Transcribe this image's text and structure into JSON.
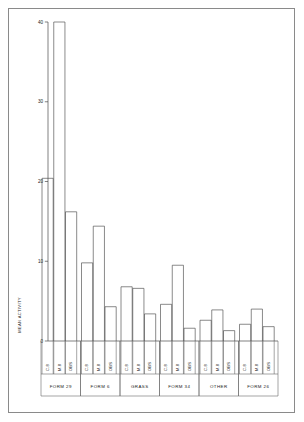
{
  "chart_data": {
    "type": "bar",
    "title": "",
    "xlabel": "",
    "ylabel": "MEAN ACTIVITY",
    "ylim": [
      0,
      40
    ],
    "yticks": [
      0,
      10,
      20,
      30,
      40
    ],
    "ytick_labels": [
      "0",
      "10",
      "20",
      "30",
      "40"
    ],
    "grid": false,
    "legend": "none",
    "categories": [
      "C.8",
      "M.8",
      "OBS"
    ],
    "groups": [
      {
        "label": "FORM 29",
        "bars": [
          {
            "label": "C.8",
            "value": 20.4
          },
          {
            "label": "M.8",
            "value": 40.0
          },
          {
            "label": "OBS",
            "value": 16.2
          }
        ]
      },
      {
        "label": "FORM 6",
        "bars": [
          {
            "label": "C.8",
            "value": 9.8
          },
          {
            "label": "M.8",
            "value": 14.4
          },
          {
            "label": "OBS",
            "value": 4.3
          }
        ]
      },
      {
        "label": "GRASS",
        "bars": [
          {
            "label": "C.8",
            "value": 6.8
          },
          {
            "label": "M.8",
            "value": 6.6
          },
          {
            "label": "OBS",
            "value": 3.4
          }
        ]
      },
      {
        "label": "FORM 34",
        "bars": [
          {
            "label": "C.8",
            "value": 4.6
          },
          {
            "label": "M.8",
            "value": 9.5
          },
          {
            "label": "OBS",
            "value": 1.6
          }
        ]
      },
      {
        "label": "OTHER",
        "bars": [
          {
            "label": "C.8",
            "value": 2.6
          },
          {
            "label": "M.8",
            "value": 3.9
          },
          {
            "label": "OBS",
            "value": 1.3
          }
        ]
      },
      {
        "label": "FORM 26",
        "bars": [
          {
            "label": "C.8",
            "value": 2.1
          },
          {
            "label": "M.8",
            "value": 4.0
          },
          {
            "label": "OBS",
            "value": 1.8
          }
        ]
      }
    ]
  }
}
